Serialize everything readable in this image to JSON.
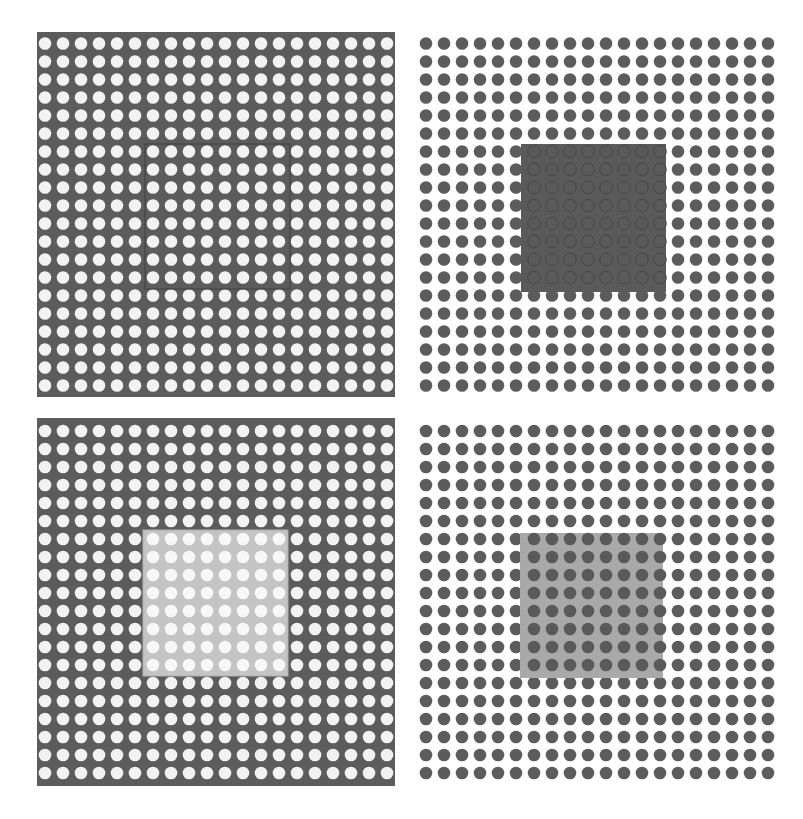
{
  "figure": {
    "grid": {
      "rows": 20,
      "cols": 20,
      "pitch": 18,
      "dot_radius": 6.3
    },
    "colors": {
      "dark": "#5c5c5c",
      "light": "#f2f2f2",
      "white": "#ffffff",
      "light_patch": "#c9c9c9",
      "mid_patch": "#a8a8a8",
      "dark_patch": "#555555"
    },
    "panels": [
      {
        "id": "top-left",
        "label": "Dark background, light dots, outlined inner square",
        "x": 37,
        "y": 32,
        "w": 358,
        "h": 365,
        "background": "#5c5c5c",
        "dot_color": "#f2f2f2",
        "inner": {
          "x": 108,
          "y": 112,
          "w": 145,
          "h": 145,
          "fill": "none",
          "stroke": "#3f3f3f",
          "stroke_width": 1,
          "opacity": 1,
          "dot_color": "#f2f2f2",
          "dot_outline": false
        }
      },
      {
        "id": "top-right",
        "label": "White background, dark dots, opaque dark inner square",
        "x": 418,
        "y": 32,
        "w": 358,
        "h": 365,
        "background": "#ffffff",
        "dot_color": "#5c5c5c",
        "inner": {
          "x": 103,
          "y": 112,
          "w": 145,
          "h": 148,
          "fill": "#5a5a5a",
          "stroke": "none",
          "stroke_width": 0,
          "opacity": 1,
          "dot_color": "none",
          "dot_outline": true
        }
      },
      {
        "id": "bottom-left",
        "label": "Dark background, light dots, light translucent inner square",
        "x": 37,
        "y": 418,
        "w": 358,
        "h": 368,
        "background": "#5c5c5c",
        "dot_color": "#f2f2f2",
        "inner": {
          "x": 106,
          "y": 112,
          "w": 145,
          "h": 146,
          "fill": "#c4c4c4",
          "stroke": "#b0b0b0",
          "stroke_width": 1,
          "opacity": 1,
          "dot_color": "#f7f7f7",
          "dot_outline": false
        }
      },
      {
        "id": "bottom-right",
        "label": "White background, dark dots, mid-grey translucent inner square",
        "x": 418,
        "y": 418,
        "w": 358,
        "h": 368,
        "background": "#ffffff",
        "dot_color": "#5c5c5c",
        "inner": {
          "x": 102,
          "y": 115,
          "w": 143,
          "h": 145,
          "fill": "#a9a9a9",
          "stroke": "none",
          "stroke_width": 0,
          "opacity": 1,
          "dot_color": "#5a5a5a",
          "dot_outline": false
        }
      }
    ],
    "caption": ""
  }
}
